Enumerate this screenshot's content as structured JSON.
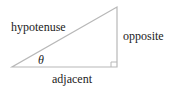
{
  "diagram": {
    "type": "right-triangle",
    "labels": {
      "hypotenuse": "hypotenuse",
      "opposite": "opposite",
      "adjacent": "adjacent",
      "angle": "θ"
    },
    "colors": {
      "line": "#b8b8b8",
      "text": "#222222"
    }
  }
}
